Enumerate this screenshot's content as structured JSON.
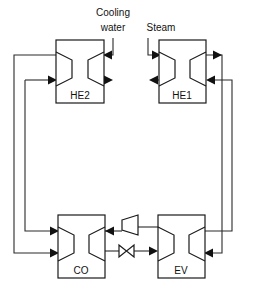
{
  "diagram": {
    "background_color": "#ffffff",
    "line_color": "#2b2b2b",
    "box_stroke_color": "#1a1a1a",
    "arrow_color": "#111111",
    "width": 257,
    "height": 289
  },
  "units": {
    "he2": {
      "label": "HE2",
      "label_x": 80,
      "label_y": 99,
      "box": {
        "x": 56,
        "y": 40,
        "w": 48,
        "h": 63
      }
    },
    "he1": {
      "label": "HE1",
      "label_x": 182,
      "label_y": 99,
      "box": {
        "x": 159,
        "y": 40,
        "w": 47,
        "h": 63
      }
    },
    "co": {
      "label": "CO",
      "label_x": 81,
      "label_y": 274,
      "box": {
        "x": 58,
        "y": 215,
        "w": 47,
        "h": 63
      }
    },
    "ev": {
      "label": "EV",
      "label_x": 181,
      "label_y": 274,
      "box": {
        "x": 158,
        "y": 215,
        "w": 47,
        "h": 63
      }
    }
  },
  "devices": {
    "compressor": {
      "name": "compressor",
      "shape": "trapezoid",
      "x": 122,
      "y": 219,
      "w": 16,
      "h": 16
    },
    "expansion_valve": {
      "name": "expansion-valve",
      "shape": "bowtie",
      "x": 119,
      "y": 245,
      "w": 15,
      "h": 11
    }
  },
  "stream_labels": {
    "cooling_water_line1": "Cooling",
    "cooling_water_line2": "water",
    "cooling_water_x": 113,
    "cooling_water_y1": 16,
    "cooling_water_y2": 31,
    "steam": "Steam",
    "steam_x": 161,
    "steam_y": 31
  },
  "streams": [
    {
      "name": "cooling-water-inlet",
      "from": "Cooling water",
      "to": "HE2"
    },
    {
      "name": "steam-inlet",
      "from": "Steam",
      "to": "HE1"
    },
    {
      "name": "he2-to-co-loop",
      "from": "HE2",
      "to": "CO"
    },
    {
      "name": "co-to-compressor",
      "from": "CO",
      "to": "compressor"
    },
    {
      "name": "compressor-to-ev",
      "from": "compressor",
      "to": "EV"
    },
    {
      "name": "ev-to-valve",
      "from": "EV",
      "to": "expansion-valve"
    },
    {
      "name": "valve-to-co",
      "from": "expansion-valve",
      "to": "CO"
    },
    {
      "name": "ev-to-he1-loop",
      "from": "EV",
      "to": "HE1"
    },
    {
      "name": "he1-right-return",
      "from": "HE1",
      "to": "EV"
    },
    {
      "name": "he2-left-return",
      "from": "HE2",
      "to": "CO"
    }
  ]
}
